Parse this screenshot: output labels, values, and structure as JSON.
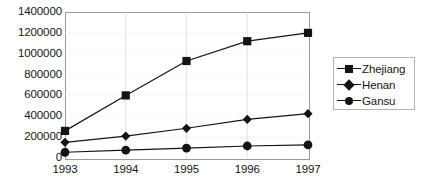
{
  "chart_data": {
    "type": "line",
    "title": "",
    "subtitle": "",
    "xlabel": "",
    "ylabel": "",
    "categories": [
      "1993",
      "1994",
      "1995",
      "1996",
      "1997"
    ],
    "x": [
      1993,
      1994,
      1995,
      1996,
      1997
    ],
    "ylim": [
      0,
      1400000
    ],
    "yticks": [
      0,
      200000,
      400000,
      600000,
      800000,
      1000000,
      1200000,
      1400000
    ],
    "ytick_labels": [
      "0",
      "200000",
      "400000",
      "600000",
      "800000",
      "1000000",
      "1200000",
      "1400000"
    ],
    "xtick_labels": [
      "1993",
      "1994",
      "1995",
      "1996",
      "1997"
    ],
    "grid": true,
    "legend_position": "right",
    "series": [
      {
        "name": "Zhejiang",
        "marker": "square",
        "color": "#141414",
        "values": [
          260000,
          600000,
          930000,
          1120000,
          1200000
        ]
      },
      {
        "name": "Henan",
        "marker": "diamond",
        "color": "#141414",
        "values": [
          150000,
          210000,
          285000,
          370000,
          425000
        ]
      },
      {
        "name": "Gansu",
        "marker": "circle",
        "color": "#141414",
        "values": [
          55000,
          75000,
          95000,
          115000,
          125000
        ]
      }
    ]
  },
  "legend": {
    "items": [
      {
        "label": "Zhejiang",
        "marker": "square"
      },
      {
        "label": "Henan",
        "marker": "diamond"
      },
      {
        "label": "Gansu",
        "marker": "circle"
      }
    ]
  },
  "style": {
    "series_color": "#141414",
    "frame_color": "#9a9a9a",
    "grid_color": "#dcdcdc",
    "text_color": "#161616",
    "background": "#ffffff"
  }
}
